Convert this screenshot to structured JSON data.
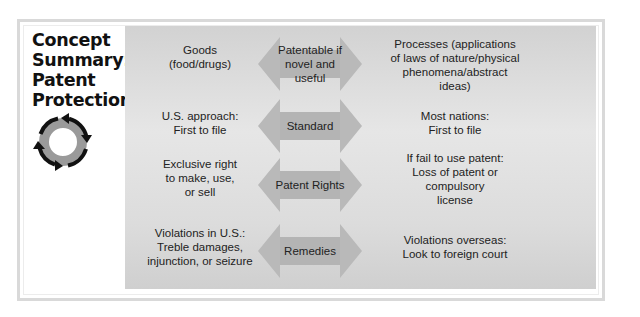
{
  "title": {
    "line1": "Concept",
    "line2": "Summary:",
    "line3": "Patent",
    "line4": "Protection"
  },
  "icon": "circular-arrows-cycle-icon",
  "colors": {
    "frame": "#d9d9d9",
    "panel": "#dcdcdc",
    "arrow_fill": "#b8b8b8",
    "cycle_ring": "#9a9a9a",
    "cycle_arrows": "#111111",
    "text": "#222222"
  },
  "rows": [
    {
      "left": [
        "Goods",
        "(food/drugs)"
      ],
      "arrow_label": [
        "Patentable if",
        "novel and useful"
      ],
      "right": [
        "Processes (applications",
        "of laws of nature/physical",
        "phenomena/abstract",
        "ideas)"
      ]
    },
    {
      "left": [
        "U.S. approach:",
        "First to file"
      ],
      "arrow_label": [
        "Standard"
      ],
      "right": [
        "Most nations:",
        "First to file"
      ]
    },
    {
      "left": [
        "Exclusive right",
        "to make, use,",
        "or sell"
      ],
      "arrow_label": [
        "Patent Rights"
      ],
      "right": [
        "If fail to use patent:",
        "Loss of patent or",
        "compulsory",
        "license"
      ]
    },
    {
      "left": [
        "Violations in U.S.:",
        "Treble damages,",
        "injunction, or seizure"
      ],
      "arrow_label": [
        "Remedies"
      ],
      "right": [
        "Violations overseas:",
        "Look to foreign court"
      ]
    }
  ]
}
